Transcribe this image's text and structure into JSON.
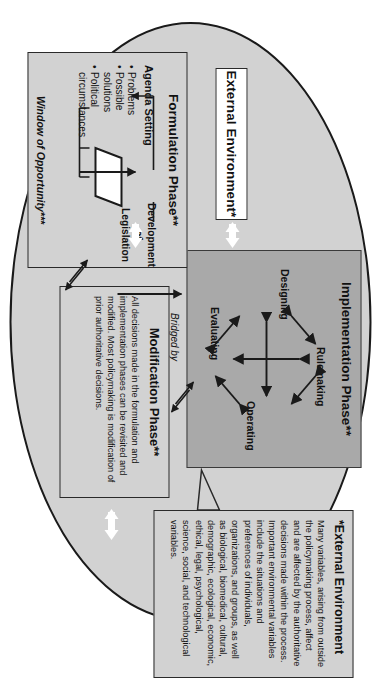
{
  "diagram": {
    "title_label": "External Environment*",
    "ellipse_color": "#d2d2d2",
    "implementation_color": "#a9a9a9"
  },
  "implementation": {
    "title": "Implementation Phase**",
    "nodes": [
      {
        "label": "Designing"
      },
      {
        "label": "Rulemaking"
      },
      {
        "label": "Operating"
      },
      {
        "label": "Evaluating"
      }
    ]
  },
  "formulation": {
    "title": "Formulation Phase**",
    "agenda_label": "Agenda Setting",
    "bullets": [
      "Problems",
      "Possible",
      "solutions",
      "Political",
      "circumstances"
    ],
    "development": "Development of Legislation",
    "development_l1": "Development",
    "development_l2": "of",
    "development_l3": "Legislation",
    "window": "Window of Opportunity***"
  },
  "bridge": {
    "l1": "Bridged by",
    "l2": "formal",
    "l3": "enactment",
    "l4": "of",
    "l5": "legislation"
  },
  "modification": {
    "title": "Modification Phase**",
    "text": "All decisions made in the formulation and implementation phases can be revisited and modified. Most policymaking is modification of prior authoritative decisions."
  },
  "external": {
    "title": "*External Environment",
    "text": "Many variables, arising from outside the policymaking process, affect and are affected by the authoritative decisions made within the process. Important environmental variables include the situations and preferences of individuals, organizations, and groups, as well as biological, biomedical, cultural, demographic, ecological, economic, ethical, legal, psychological, science, social, and technological variables."
  }
}
